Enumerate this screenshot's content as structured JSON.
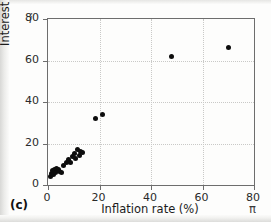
{
  "figure": {
    "panel_label": "(c)",
    "y_axis_symbol": "i",
    "x_axis_symbol": "π"
  },
  "chart_data": {
    "type": "scatter",
    "title": "",
    "xlabel": "Inflation rate (%)",
    "ylabel": "Interest rate (%)",
    "xlim": [
      0,
      80
    ],
    "ylim": [
      0,
      80
    ],
    "xticks": [
      0,
      20,
      40,
      60,
      80
    ],
    "yticks": [
      0,
      20,
      40,
      60,
      80
    ],
    "xtick_labels": [
      "0",
      "20",
      "40",
      "60",
      "80"
    ],
    "ytick_labels": [
      "0",
      "20",
      "40",
      "60",
      "80"
    ],
    "grid": true,
    "legend": null,
    "marker": "filled-circle",
    "marker_color": "#0d0d0d",
    "series": [
      {
        "name": "Countries",
        "points": [
          [
            1.0,
            4.0
          ],
          [
            1.4,
            5.5
          ],
          [
            1.8,
            7.0
          ],
          [
            2.2,
            5.0
          ],
          [
            2.6,
            7.5
          ],
          [
            3.0,
            6.0
          ],
          [
            3.4,
            8.0
          ],
          [
            4.0,
            7.5
          ],
          [
            4.6,
            6.5
          ],
          [
            5.2,
            6.2
          ],
          [
            6.0,
            9.5
          ],
          [
            7.2,
            11.0
          ],
          [
            8.0,
            12.5
          ],
          [
            8.6,
            11.0
          ],
          [
            9.4,
            13.5
          ],
          [
            10.2,
            15.0
          ],
          [
            10.8,
            13.0
          ],
          [
            11.4,
            17.0
          ],
          [
            12.2,
            14.0
          ],
          [
            12.8,
            16.0
          ],
          [
            13.4,
            15.5
          ],
          [
            18.5,
            32.0
          ],
          [
            21.0,
            34.0
          ],
          [
            48.0,
            62.0
          ],
          [
            70.0,
            66.5
          ]
        ]
      }
    ]
  }
}
